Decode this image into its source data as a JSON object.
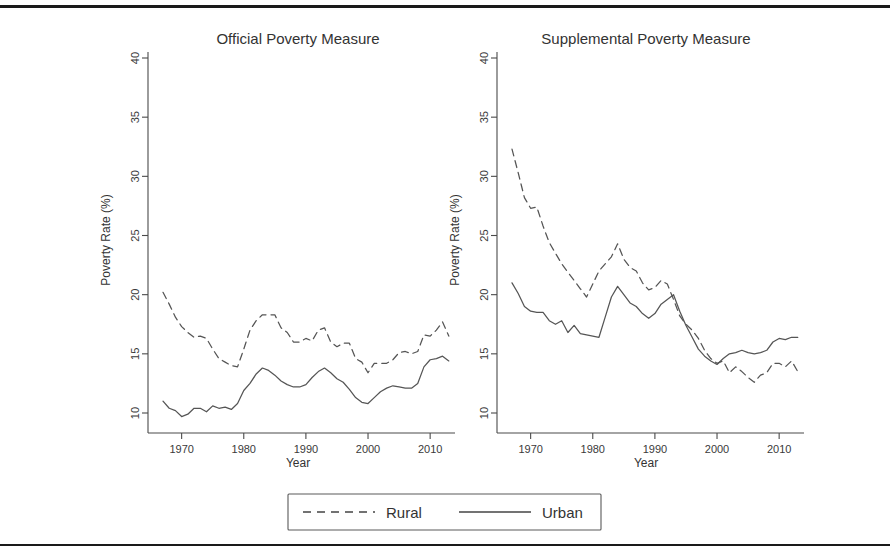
{
  "figure": {
    "name": "poverty-rate-comparison-figure",
    "top_rule_color": "#1a1a1a",
    "bottom_rule_color": "#1a1a1a"
  },
  "legend": {
    "position": "bottom-center",
    "entries": [
      {
        "label": "Rural",
        "style": "dashed"
      },
      {
        "label": "Urban",
        "style": "solid"
      }
    ]
  },
  "chart_data": [
    {
      "type": "line",
      "title": "Official Poverty Measure",
      "xlabel": "Year",
      "ylabel": "Poverty Rate (%)",
      "xlim": [
        1967,
        2014
      ],
      "ylim": [
        10,
        40
      ],
      "xticks": [
        1970,
        1980,
        1990,
        2000,
        2010
      ],
      "yticks": [
        10,
        15,
        20,
        25,
        30,
        35,
        40
      ],
      "grid": false,
      "legend_position": "bottom-center",
      "x": [
        1967,
        1968,
        1969,
        1970,
        1971,
        1972,
        1973,
        1974,
        1975,
        1976,
        1977,
        1978,
        1979,
        1980,
        1981,
        1982,
        1983,
        1984,
        1985,
        1986,
        1987,
        1988,
        1989,
        1990,
        1991,
        1992,
        1993,
        1994,
        1995,
        1996,
        1997,
        1998,
        1999,
        2000,
        2001,
        2002,
        2003,
        2004,
        2005,
        2006,
        2007,
        2008,
        2009,
        2010,
        2011,
        2012,
        2013
      ],
      "series": [
        {
          "name": "Rural",
          "style": "dashed",
          "values": [
            20.2,
            19.2,
            18.1,
            17.3,
            16.8,
            16.4,
            16.5,
            16.3,
            15.4,
            14.6,
            14.3,
            14.0,
            13.9,
            15.4,
            17.0,
            17.8,
            18.3,
            18.3,
            18.3,
            17.2,
            16.8,
            16.0,
            16.0,
            16.3,
            16.1,
            17.0,
            17.2,
            16.0,
            15.6,
            15.9,
            15.9,
            14.6,
            14.3,
            13.4,
            14.2,
            14.2,
            14.2,
            14.5,
            15.1,
            15.2,
            15.0,
            15.2,
            16.6,
            16.5,
            17.0,
            17.7,
            16.5
          ]
        },
        {
          "name": "Urban",
          "style": "solid",
          "values": [
            11.0,
            10.4,
            10.2,
            9.7,
            9.9,
            10.4,
            10.4,
            10.1,
            10.6,
            10.4,
            10.5,
            10.3,
            10.8,
            11.9,
            12.5,
            13.3,
            13.8,
            13.6,
            13.2,
            12.7,
            12.4,
            12.2,
            12.2,
            12.4,
            13.0,
            13.5,
            13.8,
            13.4,
            12.9,
            12.6,
            12.0,
            11.3,
            10.9,
            10.8,
            11.3,
            11.8,
            12.1,
            12.3,
            12.2,
            12.1,
            12.1,
            12.5,
            13.9,
            14.5,
            14.6,
            14.8,
            14.4
          ]
        }
      ]
    },
    {
      "type": "line",
      "title": "Supplemental Poverty Measure",
      "xlabel": "Year",
      "ylabel": "Poverty Rate (%)",
      "xlim": [
        1967,
        2014
      ],
      "ylim": [
        10,
        40
      ],
      "xticks": [
        1970,
        1980,
        1990,
        2000,
        2010
      ],
      "yticks": [
        10,
        15,
        20,
        25,
        30,
        35,
        40
      ],
      "grid": false,
      "legend_position": "bottom-center",
      "x": [
        1967,
        1968,
        1969,
        1970,
        1971,
        1972,
        1973,
        1974,
        1975,
        1976,
        1977,
        1978,
        1979,
        1980,
        1981,
        1982,
        1983,
        1984,
        1985,
        1986,
        1987,
        1988,
        1989,
        1990,
        1991,
        1992,
        1993,
        1994,
        1995,
        1996,
        1997,
        1998,
        1999,
        2000,
        2001,
        2002,
        2003,
        2004,
        2005,
        2006,
        2007,
        2008,
        2009,
        2010,
        2011,
        2012,
        2013
      ],
      "series": [
        {
          "name": "Rural",
          "style": "dashed",
          "values": [
            32.3,
            30.3,
            28.2,
            27.3,
            27.4,
            25.8,
            24.4,
            23.5,
            22.6,
            21.9,
            21.2,
            20.5,
            19.8,
            20.9,
            22.0,
            22.6,
            23.2,
            24.3,
            23.0,
            22.3,
            22.0,
            21.0,
            20.4,
            20.6,
            21.2,
            20.9,
            19.6,
            18.2,
            17.5,
            17.0,
            16.3,
            15.3,
            14.6,
            14.2,
            14.4,
            13.4,
            13.9,
            13.5,
            13.0,
            12.6,
            13.2,
            13.4,
            14.2,
            14.2,
            13.9,
            14.4,
            13.5
          ]
        },
        {
          "name": "Urban",
          "style": "solid",
          "values": [
            21.0,
            20.1,
            19.0,
            18.6,
            18.5,
            18.5,
            17.8,
            17.5,
            17.8,
            16.8,
            17.4,
            16.7,
            16.6,
            16.5,
            16.4,
            18.1,
            19.8,
            20.7,
            20.0,
            19.3,
            19.0,
            18.4,
            18.0,
            18.4,
            19.2,
            19.6,
            20.0,
            18.6,
            17.4,
            16.4,
            15.4,
            14.8,
            14.4,
            14.1,
            14.6,
            15.0,
            15.1,
            15.3,
            15.1,
            15.0,
            15.1,
            15.3,
            16.0,
            16.3,
            16.2,
            16.4,
            16.4
          ]
        }
      ]
    }
  ]
}
